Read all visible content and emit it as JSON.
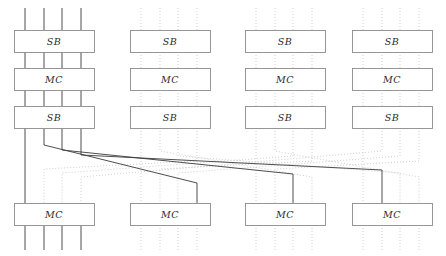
{
  "figure": {
    "name": "aes-round-permutation-diagram",
    "width": 446,
    "height": 256,
    "background": "#ffffff"
  },
  "style": {
    "solid_wire_color": "#3a3a3a",
    "dotted_wire_color": "#c8c8c8",
    "box_stroke": "#8c8c8c",
    "box_fill": "#ffffff",
    "label_color": "#2b2b2b",
    "label_font_size": "9.5px",
    "wire_width": 0.9
  },
  "geometry": {
    "columns": [
      {
        "index": 0,
        "box_x": 14,
        "box_w": 80,
        "active": true,
        "wires": [
          25,
          44,
          62,
          81
        ]
      },
      {
        "index": 1,
        "box_x": 130,
        "box_w": 80,
        "active": false,
        "wires": [
          141,
          160,
          178,
          197
        ]
      },
      {
        "index": 2,
        "box_x": 245,
        "box_w": 80,
        "active": false,
        "wires": [
          256,
          275,
          293,
          312
        ]
      },
      {
        "index": 3,
        "box_x": 352,
        "box_w": 80,
        "active": false,
        "wires": [
          363,
          382,
          400,
          419
        ]
      }
    ],
    "rows": [
      {
        "index": 0,
        "label": "SB",
        "y": 30,
        "h": 22
      },
      {
        "index": 1,
        "label": "MC",
        "y": 68,
        "h": 22
      },
      {
        "index": 2,
        "label": "SB",
        "y": 106,
        "h": 22
      },
      {
        "index": 3,
        "label": "MC",
        "y": 203,
        "h": 22
      }
    ],
    "top_wire_y": 8,
    "bottom_wire_y": 250,
    "crossing_top_y": 128,
    "crossing_bottom_y": 203
  },
  "boxes": [
    {
      "id": "c0r0",
      "label": "SB",
      "col": 0,
      "row": 0
    },
    {
      "id": "c0r1",
      "label": "MC",
      "col": 0,
      "row": 1
    },
    {
      "id": "c0r2",
      "label": "SB",
      "col": 0,
      "row": 2
    },
    {
      "id": "c0r3",
      "label": "MC",
      "col": 0,
      "row": 3
    },
    {
      "id": "c1r0",
      "label": "SB",
      "col": 1,
      "row": 0
    },
    {
      "id": "c1r1",
      "label": "MC",
      "col": 1,
      "row": 1
    },
    {
      "id": "c1r2",
      "label": "SB",
      "col": 1,
      "row": 2
    },
    {
      "id": "c1r3",
      "label": "MC",
      "col": 1,
      "row": 3
    },
    {
      "id": "c2r0",
      "label": "SB",
      "col": 2,
      "row": 0
    },
    {
      "id": "c2r1",
      "label": "MC",
      "col": 2,
      "row": 1
    },
    {
      "id": "c2r2",
      "label": "SB",
      "col": 2,
      "row": 2
    },
    {
      "id": "c2r3",
      "label": "MC",
      "col": 2,
      "row": 3
    },
    {
      "id": "c3r0",
      "label": "SB",
      "col": 3,
      "row": 0
    },
    {
      "id": "c3r1",
      "label": "MC",
      "col": 3,
      "row": 1
    },
    {
      "id": "c3r2",
      "label": "SB",
      "col": 3,
      "row": 2
    },
    {
      "id": "c3r3",
      "label": "MC",
      "col": 3,
      "row": 3
    }
  ],
  "permutation": {
    "description": "shiftrows-style crossing network between third SB row and final MC row",
    "solid_routes": [
      {
        "from_col": 0,
        "from_wire": 0,
        "to_col": 0,
        "to_wire": 0,
        "drop_y": 203,
        "bend_y": 128
      },
      {
        "from_col": 0,
        "from_wire": 1,
        "to_col": 1,
        "to_wire": 3,
        "drop_y": 145,
        "bend_y": 183
      },
      {
        "from_col": 0,
        "from_wire": 2,
        "to_col": 2,
        "to_wire": 2,
        "drop_y": 150,
        "bend_y": 174
      },
      {
        "from_col": 0,
        "from_wire": 3,
        "to_col": 3,
        "to_wire": 1,
        "drop_y": 155,
        "bend_y": 170
      }
    ],
    "dotted_routes": [
      {
        "from_col": 1,
        "from_wire": 0,
        "to_col": 1,
        "to_wire": 0
      },
      {
        "from_col": 1,
        "from_wire": 1,
        "to_col": 2,
        "to_wire": 3
      },
      {
        "from_col": 1,
        "from_wire": 2,
        "to_col": 3,
        "to_wire": 2
      },
      {
        "from_col": 1,
        "from_wire": 3,
        "to_col": 0,
        "to_wire": 1
      },
      {
        "from_col": 2,
        "from_wire": 0,
        "to_col": 2,
        "to_wire": 0
      },
      {
        "from_col": 2,
        "from_wire": 1,
        "to_col": 3,
        "to_wire": 3
      },
      {
        "from_col": 2,
        "from_wire": 2,
        "to_col": 0,
        "to_wire": 2
      },
      {
        "from_col": 2,
        "from_wire": 3,
        "to_col": 1,
        "to_wire": 1
      },
      {
        "from_col": 3,
        "from_wire": 0,
        "to_col": 3,
        "to_wire": 0
      },
      {
        "from_col": 3,
        "from_wire": 1,
        "to_col": 0,
        "to_wire": 3
      },
      {
        "from_col": 3,
        "from_wire": 2,
        "to_col": 1,
        "to_wire": 2
      },
      {
        "from_col": 3,
        "from_wire": 3,
        "to_col": 2,
        "to_wire": 1
      }
    ]
  }
}
